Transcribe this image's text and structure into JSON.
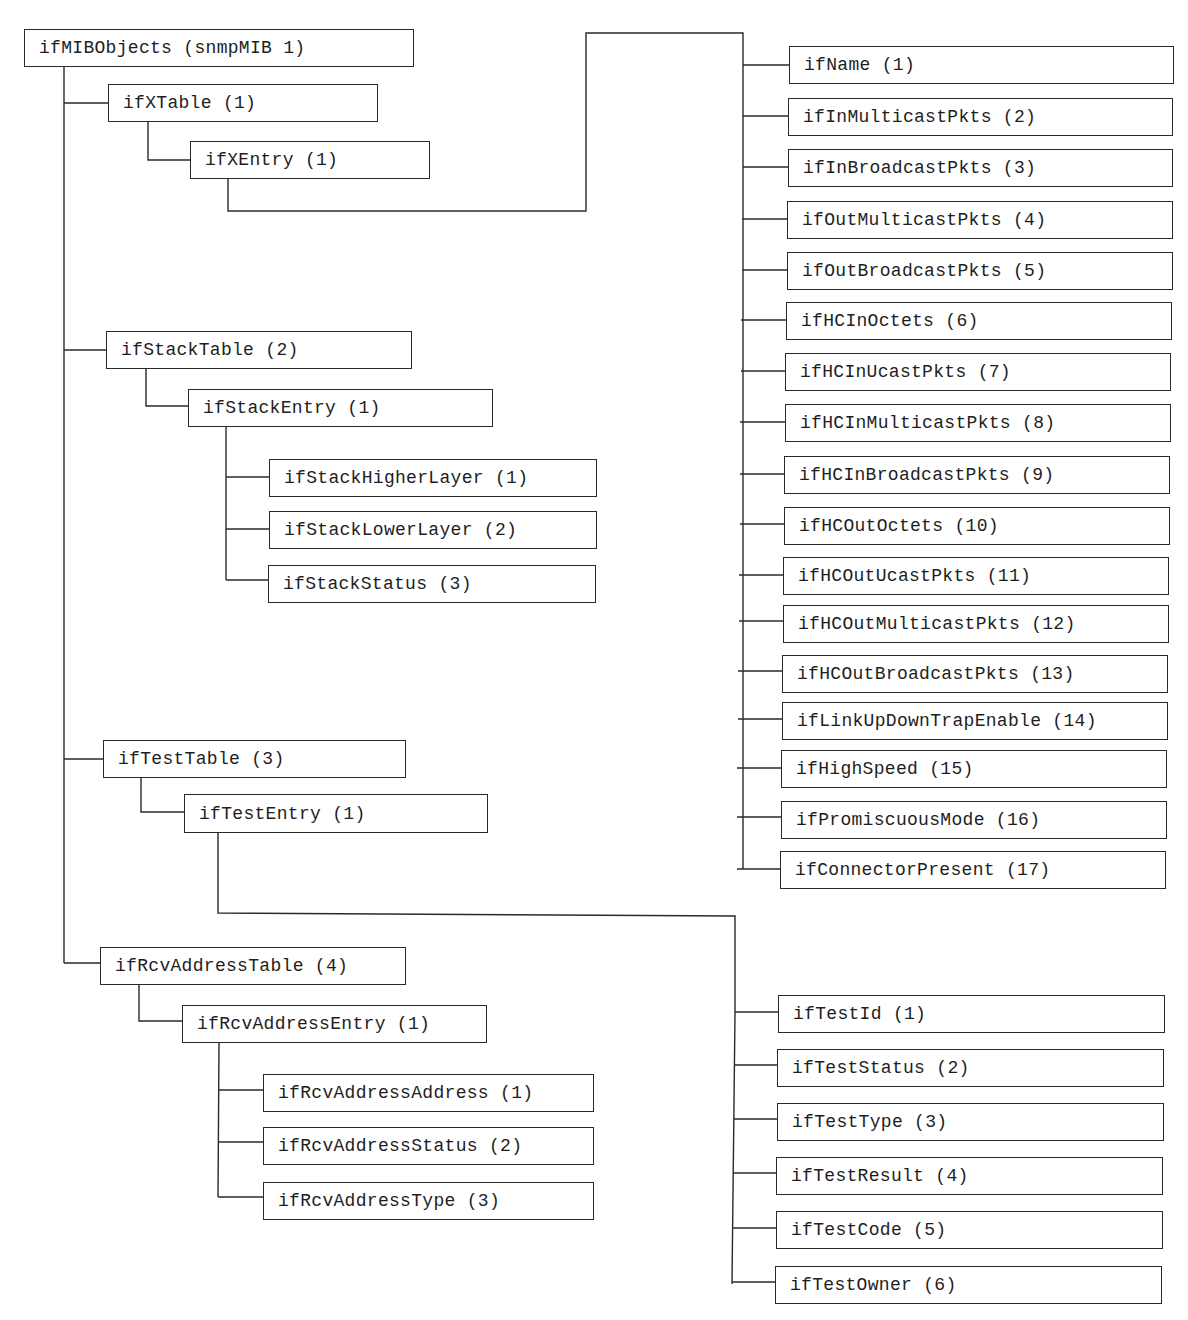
{
  "diagram": {
    "type": "tree",
    "title": "ifMIBObjects (snmpMIB 1)",
    "colors": {
      "line": "#2a2a2a",
      "box_border": "#2a2a2a",
      "text": "#1e1e1e",
      "background": "#ffffff"
    },
    "nodes": [
      {
        "id": "root",
        "label": "ifMIBObjects (snmpMIB 1)",
        "x": 24,
        "y": 29,
        "w": 390,
        "h": 38
      },
      {
        "id": "ifXTable",
        "label": "ifXTable (1)",
        "x": 108,
        "y": 84,
        "w": 270,
        "h": 38
      },
      {
        "id": "ifXEntry",
        "label": "ifXEntry (1)",
        "x": 190,
        "y": 141,
        "w": 240,
        "h": 38
      },
      {
        "id": "ifName",
        "label": "ifName (1)",
        "x": 789,
        "y": 46,
        "w": 385,
        "h": 38
      },
      {
        "id": "ifInMulticastPkts",
        "label": "ifInMulticastPkts (2)",
        "x": 788,
        "y": 98,
        "w": 385,
        "h": 38
      },
      {
        "id": "ifInBroadcastPkts",
        "label": "ifInBroadcastPkts (3)",
        "x": 788,
        "y": 149,
        "w": 385,
        "h": 38
      },
      {
        "id": "ifOutMulticastPkts",
        "label": "ifOutMulticastPkts (4)",
        "x": 787,
        "y": 201,
        "w": 386,
        "h": 38
      },
      {
        "id": "ifOutBroadcastPkts",
        "label": "ifOutBroadcastPkts (5)",
        "x": 787,
        "y": 252,
        "w": 386,
        "h": 38
      },
      {
        "id": "ifHCInOctets",
        "label": "ifHCInOctets (6)",
        "x": 786,
        "y": 302,
        "w": 386,
        "h": 38
      },
      {
        "id": "ifHCInUcastPkts",
        "label": "ifHCInUcastPkts (7)",
        "x": 785,
        "y": 353,
        "w": 386,
        "h": 38
      },
      {
        "id": "ifHCInMulticastPkts",
        "label": "ifHCInMulticastPkts (8)",
        "x": 785,
        "y": 404,
        "w": 386,
        "h": 38
      },
      {
        "id": "ifHCInBroadcastPkts",
        "label": "ifHCInBroadcastPkts (9)",
        "x": 784,
        "y": 456,
        "w": 386,
        "h": 38
      },
      {
        "id": "ifHCOutOctets",
        "label": "ifHCOutOctets (10)",
        "x": 784,
        "y": 507,
        "w": 386,
        "h": 38
      },
      {
        "id": "ifHCOutUcastPkts",
        "label": "ifHCOutUcastPkts (11)",
        "x": 783,
        "y": 557,
        "w": 386,
        "h": 38
      },
      {
        "id": "ifHCOutMulticastPkts",
        "label": "ifHCOutMulticastPkts (12)",
        "x": 783,
        "y": 605,
        "w": 386,
        "h": 38
      },
      {
        "id": "ifHCOutBroadcastPkts",
        "label": "ifHCOutBroadcastPkts (13)",
        "x": 782,
        "y": 655,
        "w": 386,
        "h": 38
      },
      {
        "id": "ifLinkUpDownTrapEnable",
        "label": "ifLinkUpDownTrapEnable (14)",
        "x": 782,
        "y": 702,
        "w": 386,
        "h": 38
      },
      {
        "id": "ifHighSpeed",
        "label": "ifHighSpeed (15)",
        "x": 781,
        "y": 750,
        "w": 386,
        "h": 38
      },
      {
        "id": "ifPromiscuousMode",
        "label": "ifPromiscuousMode (16)",
        "x": 781,
        "y": 801,
        "w": 386,
        "h": 38
      },
      {
        "id": "ifConnectorPresent",
        "label": "ifConnectorPresent (17)",
        "x": 780,
        "y": 851,
        "w": 386,
        "h": 38
      },
      {
        "id": "ifStackTable",
        "label": "ifStackTable (2)",
        "x": 106,
        "y": 331,
        "w": 306,
        "h": 38
      },
      {
        "id": "ifStackEntry",
        "label": "ifStackEntry (1)",
        "x": 188,
        "y": 389,
        "w": 305,
        "h": 38
      },
      {
        "id": "ifStackHigherLayer",
        "label": "ifStackHigherLayer (1)",
        "x": 269,
        "y": 459,
        "w": 328,
        "h": 38
      },
      {
        "id": "ifStackLowerLayer",
        "label": "ifStackLowerLayer (2)",
        "x": 269,
        "y": 511,
        "w": 328,
        "h": 38
      },
      {
        "id": "ifStackStatus",
        "label": "ifStackStatus (3)",
        "x": 268,
        "y": 565,
        "w": 328,
        "h": 38
      },
      {
        "id": "ifTestTable",
        "label": "ifTestTable (3)",
        "x": 103,
        "y": 740,
        "w": 303,
        "h": 38
      },
      {
        "id": "ifTestEntry",
        "label": "ifTestEntry (1)",
        "x": 184,
        "y": 794,
        "w": 304,
        "h": 39
      },
      {
        "id": "ifTestId",
        "label": "ifTestId (1)",
        "x": 778,
        "y": 995,
        "w": 387,
        "h": 38
      },
      {
        "id": "ifTestStatus",
        "label": "ifTestStatus (2)",
        "x": 777,
        "y": 1049,
        "w": 387,
        "h": 38
      },
      {
        "id": "ifTestType",
        "label": "ifTestType (3)",
        "x": 777,
        "y": 1103,
        "w": 387,
        "h": 38
      },
      {
        "id": "ifTestResult",
        "label": "ifTestResult (4)",
        "x": 776,
        "y": 1157,
        "w": 387,
        "h": 38
      },
      {
        "id": "ifTestCode",
        "label": "ifTestCode (5)",
        "x": 776,
        "y": 1211,
        "w": 387,
        "h": 38
      },
      {
        "id": "ifTestOwner",
        "label": "ifTestOwner (6)",
        "x": 775,
        "y": 1266,
        "w": 387,
        "h": 38
      },
      {
        "id": "ifRcvAddressTable",
        "label": "ifRcvAddressTable (4)",
        "x": 100,
        "y": 947,
        "w": 306,
        "h": 38
      },
      {
        "id": "ifRcvAddressEntry",
        "label": "ifRcvAddressEntry (1)",
        "x": 182,
        "y": 1005,
        "w": 305,
        "h": 38
      },
      {
        "id": "ifRcvAddressAddress",
        "label": "ifRcvAddressAddress (1)",
        "x": 263,
        "y": 1074,
        "w": 331,
        "h": 38
      },
      {
        "id": "ifRcvAddressStatus",
        "label": "ifRcvAddressStatus (2)",
        "x": 263,
        "y": 1127,
        "w": 331,
        "h": 38
      },
      {
        "id": "ifRcvAddressType",
        "label": "ifRcvAddressType (3)",
        "x": 263,
        "y": 1182,
        "w": 331,
        "h": 38
      }
    ],
    "edges": [
      {
        "from": "root",
        "to": "ifXTable"
      },
      {
        "from": "root",
        "to": "ifStackTable"
      },
      {
        "from": "root",
        "to": "ifTestTable"
      },
      {
        "from": "root",
        "to": "ifRcvAddressTable"
      },
      {
        "from": "ifXTable",
        "to": "ifXEntry"
      },
      {
        "from": "ifXEntry",
        "to": "ifName"
      },
      {
        "from": "ifXEntry",
        "to": "ifInMulticastPkts"
      },
      {
        "from": "ifXEntry",
        "to": "ifInBroadcastPkts"
      },
      {
        "from": "ifXEntry",
        "to": "ifOutMulticastPkts"
      },
      {
        "from": "ifXEntry",
        "to": "ifOutBroadcastPkts"
      },
      {
        "from": "ifXEntry",
        "to": "ifHCInOctets"
      },
      {
        "from": "ifXEntry",
        "to": "ifHCInUcastPkts"
      },
      {
        "from": "ifXEntry",
        "to": "ifHCInMulticastPkts"
      },
      {
        "from": "ifXEntry",
        "to": "ifHCInBroadcastPkts"
      },
      {
        "from": "ifXEntry",
        "to": "ifHCOutOctets"
      },
      {
        "from": "ifXEntry",
        "to": "ifHCOutUcastPkts"
      },
      {
        "from": "ifXEntry",
        "to": "ifHCOutMulticastPkts"
      },
      {
        "from": "ifXEntry",
        "to": "ifHCOutBroadcastPkts"
      },
      {
        "from": "ifXEntry",
        "to": "ifLinkUpDownTrapEnable"
      },
      {
        "from": "ifXEntry",
        "to": "ifHighSpeed"
      },
      {
        "from": "ifXEntry",
        "to": "ifPromiscuousMode"
      },
      {
        "from": "ifXEntry",
        "to": "ifConnectorPresent"
      },
      {
        "from": "ifStackTable",
        "to": "ifStackEntry"
      },
      {
        "from": "ifStackEntry",
        "to": "ifStackHigherLayer"
      },
      {
        "from": "ifStackEntry",
        "to": "ifStackLowerLayer"
      },
      {
        "from": "ifStackEntry",
        "to": "ifStackStatus"
      },
      {
        "from": "ifTestTable",
        "to": "ifTestEntry"
      },
      {
        "from": "ifTestEntry",
        "to": "ifTestId"
      },
      {
        "from": "ifTestEntry",
        "to": "ifTestStatus"
      },
      {
        "from": "ifTestEntry",
        "to": "ifTestType"
      },
      {
        "from": "ifTestEntry",
        "to": "ifTestResult"
      },
      {
        "from": "ifTestEntry",
        "to": "ifTestCode"
      },
      {
        "from": "ifTestEntry",
        "to": "ifTestOwner"
      },
      {
        "from": "ifRcvAddressTable",
        "to": "ifRcvAddressEntry"
      },
      {
        "from": "ifRcvAddressEntry",
        "to": "ifRcvAddressAddress"
      },
      {
        "from": "ifRcvAddressEntry",
        "to": "ifRcvAddressStatus"
      },
      {
        "from": "ifRcvAddressEntry",
        "to": "ifRcvAddressType"
      }
    ],
    "connectors": [
      {
        "id": "root-trunk",
        "points": [
          [
            64,
            67
          ],
          [
            64,
            963
          ]
        ]
      },
      {
        "id": "root-ifXTable",
        "points": [
          [
            64,
            103
          ],
          [
            108,
            103
          ]
        ]
      },
      {
        "id": "root-ifStackTable",
        "points": [
          [
            64,
            350
          ],
          [
            106,
            350
          ]
        ]
      },
      {
        "id": "root-ifTestTable",
        "points": [
          [
            64,
            759
          ],
          [
            103,
            759
          ]
        ]
      },
      {
        "id": "root-ifRcvAddressTable",
        "points": [
          [
            64,
            963
          ],
          [
            100,
            963
          ]
        ]
      },
      {
        "id": "ifXTable-ifXEntry",
        "points": [
          [
            148,
            122
          ],
          [
            148,
            160
          ],
          [
            190,
            160
          ]
        ]
      },
      {
        "id": "ifXEntry-route",
        "points": [
          [
            228,
            179
          ],
          [
            228,
            211
          ],
          [
            586,
            211
          ],
          [
            586,
            33
          ],
          [
            743,
            33
          ],
          [
            743,
            65
          ]
        ]
      },
      {
        "id": "ifXEntry-trunk",
        "points": [
          [
            743,
            65
          ],
          [
            743,
            869
          ]
        ]
      },
      {
        "id": "ifXEntry-c1",
        "points": [
          [
            743,
            65
          ],
          [
            789,
            65
          ]
        ]
      },
      {
        "id": "ifXEntry-c2",
        "points": [
          [
            743,
            116
          ],
          [
            788,
            116
          ]
        ]
      },
      {
        "id": "ifXEntry-c3",
        "points": [
          [
            743,
            167
          ],
          [
            788,
            167
          ]
        ]
      },
      {
        "id": "ifXEntry-c4",
        "points": [
          [
            742,
            219
          ],
          [
            787,
            219
          ]
        ]
      },
      {
        "id": "ifXEntry-c5",
        "points": [
          [
            742,
            270
          ],
          [
            787,
            270
          ]
        ]
      },
      {
        "id": "ifXEntry-c6",
        "points": [
          [
            741,
            320
          ],
          [
            786,
            320
          ]
        ]
      },
      {
        "id": "ifXEntry-c7",
        "points": [
          [
            741,
            371
          ],
          [
            785,
            371
          ]
        ]
      },
      {
        "id": "ifXEntry-c8",
        "points": [
          [
            740,
            422
          ],
          [
            785,
            422
          ]
        ]
      },
      {
        "id": "ifXEntry-c9",
        "points": [
          [
            740,
            474
          ],
          [
            784,
            474
          ]
        ]
      },
      {
        "id": "ifXEntry-c10",
        "points": [
          [
            740,
            524
          ],
          [
            784,
            524
          ]
        ]
      },
      {
        "id": "ifXEntry-c11",
        "points": [
          [
            739,
            575
          ],
          [
            783,
            575
          ]
        ]
      },
      {
        "id": "ifXEntry-c12",
        "points": [
          [
            739,
            621
          ],
          [
            783,
            621
          ]
        ]
      },
      {
        "id": "ifXEntry-c13",
        "points": [
          [
            738,
            671
          ],
          [
            782,
            671
          ]
        ]
      },
      {
        "id": "ifXEntry-c14",
        "points": [
          [
            738,
            719
          ],
          [
            782,
            719
          ]
        ]
      },
      {
        "id": "ifXEntry-c15",
        "points": [
          [
            737,
            768
          ],
          [
            781,
            768
          ]
        ]
      },
      {
        "id": "ifXEntry-c16",
        "points": [
          [
            737,
            817
          ],
          [
            781,
            817
          ]
        ]
      },
      {
        "id": "ifXEntry-c17",
        "points": [
          [
            737,
            869
          ],
          [
            780,
            869
          ]
        ]
      },
      {
        "id": "ifStackTable-ifStackEntry",
        "points": [
          [
            146,
            369
          ],
          [
            146,
            406
          ],
          [
            188,
            406
          ]
        ]
      },
      {
        "id": "ifStackEntry-trunk",
        "points": [
          [
            226,
            427
          ],
          [
            226,
            580
          ]
        ]
      },
      {
        "id": "ifStackEntry-c1",
        "points": [
          [
            226,
            477
          ],
          [
            269,
            477
          ]
        ]
      },
      {
        "id": "ifStackEntry-c2",
        "points": [
          [
            226,
            529
          ],
          [
            269,
            529
          ]
        ]
      },
      {
        "id": "ifStackEntry-c3",
        "points": [
          [
            226,
            580
          ],
          [
            268,
            580
          ]
        ]
      },
      {
        "id": "ifTestTable-ifTestEntry",
        "points": [
          [
            141,
            778
          ],
          [
            141,
            812
          ],
          [
            184,
            812
          ]
        ]
      },
      {
        "id": "ifTestEntry-route",
        "points": [
          [
            218,
            833
          ],
          [
            218,
            913
          ],
          [
            735,
            916
          ],
          [
            735,
            1013
          ]
        ]
      },
      {
        "id": "ifTestEntry-trunk",
        "points": [
          [
            735,
            1013
          ],
          [
            732,
            1284
          ]
        ]
      },
      {
        "id": "ifTestEntry-c1",
        "points": [
          [
            735,
            1012
          ],
          [
            778,
            1012
          ]
        ]
      },
      {
        "id": "ifTestEntry-c2",
        "points": [
          [
            734,
            1065
          ],
          [
            777,
            1065
          ]
        ]
      },
      {
        "id": "ifTestEntry-c3",
        "points": [
          [
            734,
            1119
          ],
          [
            777,
            1119
          ]
        ]
      },
      {
        "id": "ifTestEntry-c4",
        "points": [
          [
            733,
            1173
          ],
          [
            776,
            1173
          ]
        ]
      },
      {
        "id": "ifTestEntry-c5",
        "points": [
          [
            733,
            1228
          ],
          [
            776,
            1228
          ]
        ]
      },
      {
        "id": "ifTestEntry-c6",
        "points": [
          [
            732,
            1282
          ],
          [
            775,
            1282
          ]
        ]
      },
      {
        "id": "ifRcvAddressTable-ifRcvAddressEntry",
        "points": [
          [
            139,
            985
          ],
          [
            139,
            1021
          ],
          [
            182,
            1021
          ]
        ]
      },
      {
        "id": "ifRcvAddressEntry-trunk",
        "points": [
          [
            219,
            1043
          ],
          [
            218,
            1197
          ]
        ]
      },
      {
        "id": "ifRcvAddressEntry-c1",
        "points": [
          [
            219,
            1090
          ],
          [
            263,
            1090
          ]
        ]
      },
      {
        "id": "ifRcvAddressEntry-c2",
        "points": [
          [
            218,
            1142
          ],
          [
            263,
            1142
          ]
        ]
      },
      {
        "id": "ifRcvAddressEntry-c3",
        "points": [
          [
            218,
            1197
          ],
          [
            263,
            1197
          ]
        ]
      }
    ]
  }
}
